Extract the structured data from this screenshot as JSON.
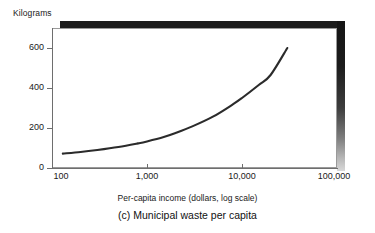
{
  "figure": {
    "y_unit_label": "Kilograms",
    "x_axis_title": "Per-capita income (dollars, log scale)",
    "panel_caption": "(c) Municipal waste per capita",
    "curve_color": "#2b2b2b",
    "frame_color": "#9a9a9a",
    "shadow_color": "#1c1c1c"
  },
  "axes": {
    "y_ticks": [
      {
        "label": "0",
        "value": 0
      },
      {
        "label": "200",
        "value": 200
      },
      {
        "label": "400",
        "value": 400
      },
      {
        "label": "600",
        "value": 600
      }
    ],
    "x_ticks": [
      {
        "label": "100",
        "value": 100
      },
      {
        "label": "1,000",
        "value": 1000
      },
      {
        "label": "10,000",
        "value": 10000
      },
      {
        "label": "100,000",
        "value": 100000
      }
    ]
  },
  "chart_data": {
    "type": "line",
    "title": "(c) Municipal waste per capita",
    "xlabel": "Per-capita income (dollars, log scale)",
    "ylabel": "Kilograms",
    "xscale": "log",
    "yscale": "linear",
    "xlim": [
      100,
      100000
    ],
    "ylim": [
      0,
      700
    ],
    "grid": false,
    "legend": null,
    "series": [
      {
        "name": "Municipal waste per capita",
        "x": [
          130,
          200,
          300,
          500,
          800,
          1000,
          1500,
          2000,
          3000,
          5000,
          8000,
          10000,
          15000,
          20000,
          30000
        ],
        "y": [
          72,
          80,
          90,
          105,
          123,
          133,
          155,
          175,
          208,
          258,
          318,
          350,
          415,
          465,
          600
        ]
      }
    ]
  }
}
